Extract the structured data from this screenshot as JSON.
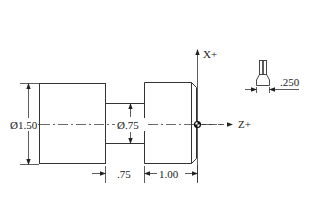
{
  "drawing": {
    "axes": {
      "x_label": "X+",
      "z_label": "Z+"
    },
    "dimensions": {
      "large_diameter": "Ø1.50",
      "neck_diameter": "Ø.75",
      "neck_length": ".75",
      "right_length": "1.00",
      "tool_width": ".250"
    },
    "colors": {
      "line": "#333333",
      "background": "#ffffff"
    }
  }
}
